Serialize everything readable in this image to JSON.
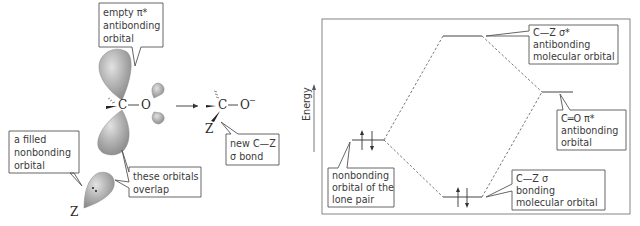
{
  "left_panel": {
    "callouts": {
      "empty_pi_star": [
        "empty π*",
        "antibonding",
        "orbital"
      ],
      "filled_nonbonding": [
        "a filled",
        "nonbonding",
        "orbital"
      ],
      "overlap": [
        "these orbitals",
        "overlap"
      ],
      "new_bond": [
        "new C—Z",
        "σ bond"
      ]
    },
    "reactant": {
      "carbon": "C",
      "oxygen": "O",
      "nucleophile": "Z",
      "bond": "—"
    },
    "product": {
      "carbon": "C",
      "oxygen": "O",
      "charge": "−",
      "nucleophile": "Z",
      "bond": "—"
    },
    "arrow": "→"
  },
  "right_panel": {
    "axis_label": "Energy",
    "levels": {
      "sigma_star": [
        "C—Z  σ*",
        "antibonding",
        "molecular orbital"
      ],
      "pi_star": [
        "C═O  π*",
        "antibonding",
        "orbital"
      ],
      "nonbonding": [
        "nonbonding",
        "orbital of the",
        "lone pair"
      ],
      "sigma": [
        "C—Z  σ",
        "bonding",
        "molecular orbital"
      ]
    }
  },
  "colors": {
    "orbital_fill": "#a9a9a9",
    "orbital_light": "#d6d6d6",
    "line": "#444444"
  }
}
